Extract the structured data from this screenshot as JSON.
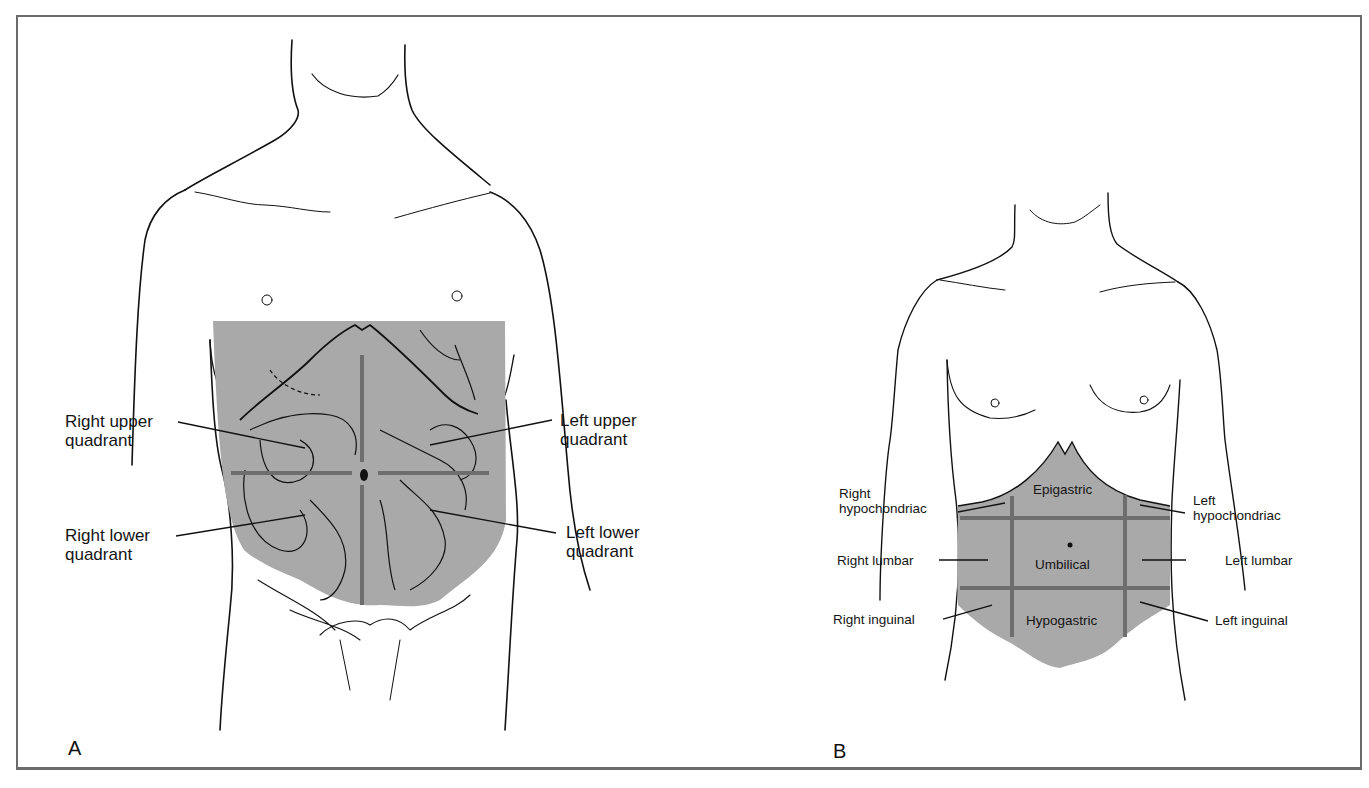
{
  "figure": {
    "panel_a": {
      "letter": "A",
      "title": "Abdominal quadrants",
      "labels": {
        "ruq": [
          "Right upper",
          "quadrant"
        ],
        "rlq": [
          "Right lower",
          "quadrant"
        ],
        "luq": [
          "Left upper",
          "quadrant"
        ],
        "llq": [
          "Left lower",
          "quadrant"
        ]
      }
    },
    "panel_b": {
      "letter": "B",
      "title": "Abdominal regions",
      "labels": {
        "right_hypochondriac": [
          "Right",
          "hypochondriac"
        ],
        "left_hypochondriac": [
          "Left",
          "hypochondriac"
        ],
        "epigastric": "Epigastric",
        "right_lumbar": "Right lumbar",
        "umbilical": "Umbilical",
        "left_lumbar": "Left lumbar",
        "right_inguinal": "Right inguinal",
        "hypogastric": "Hypogastric",
        "left_inguinal": "Left inguinal"
      }
    },
    "colors": {
      "shade": "#a9a9a9",
      "grid_line": "#6e6e6e",
      "outline": "#111111",
      "frame": "#6b6b6b"
    }
  }
}
